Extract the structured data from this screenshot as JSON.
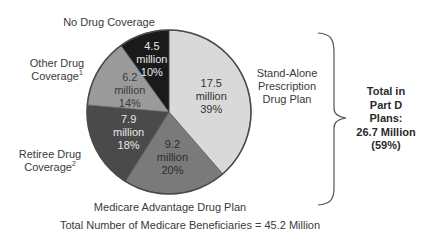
{
  "chart_data": {
    "type": "pie",
    "title": "",
    "start_angle_deg": 0,
    "direction": "clockwise",
    "slices": [
      {
        "label": "Stand-Alone Prescription Drug Plan",
        "value": 17.5,
        "value_text": "17.5",
        "unit": "million",
        "percent_text": "39%",
        "color": "#d9d9d9",
        "text_color": "#333333"
      },
      {
        "label": "Medicare Advantage Drug Plan",
        "value": 9.2,
        "value_text": "9.2",
        "unit": "million",
        "percent_text": "20%",
        "color": "#7a7a7a",
        "text_color": "#2a2a2a"
      },
      {
        "label": "Retiree Drug Coverage",
        "footnote": "2",
        "value": 7.9,
        "value_text": "7.9",
        "unit": "million",
        "percent_text": "18%",
        "color": "#4a4a4a",
        "text_color": "#e8e8e8"
      },
      {
        "label": "Other Drug Coverage",
        "footnote": "1",
        "value": 6.2,
        "value_text": "6.2",
        "unit": "million",
        "percent_text": "14%",
        "color": "#9a9a9a",
        "text_color": "#3a3a3a"
      },
      {
        "label": "No Drug Coverage",
        "value": 4.5,
        "value_text": "4.5",
        "unit": "million",
        "percent_text": "10%",
        "color": "#1a1a1a",
        "text_color": "#e8e8e8"
      }
    ],
    "annotation": {
      "bracket_covers": [
        "Stand-Alone Prescription Drug Plan",
        "Medicare Advantage Drug Plan"
      ],
      "lines": [
        "Total in",
        "Part D",
        "Plans:",
        "26.7 Million",
        "(59%)"
      ]
    },
    "footer": "Total Number of Medicare Beneficiaries = 45.2 Million"
  },
  "labels": {
    "no_drug": "No Drug Coverage",
    "other_line1": "Other Drug",
    "other_line2": "Coverage",
    "other_sup": "1",
    "retiree_line1": "Retiree Drug",
    "retiree_line2": "Coverage",
    "retiree_sup": "2",
    "standalone_line1": "Stand-Alone",
    "standalone_line2": "Prescription",
    "standalone_line3": "Drug Plan",
    "ma": "Medicare Advantage Drug Plan"
  },
  "total": {
    "line1": "Total in",
    "line2": "Part D",
    "line3": "Plans:",
    "line4": "26.7 Million",
    "line5": "(59%)"
  },
  "footer": "Total Number of Medicare Beneficiaries = 45.2 Million"
}
